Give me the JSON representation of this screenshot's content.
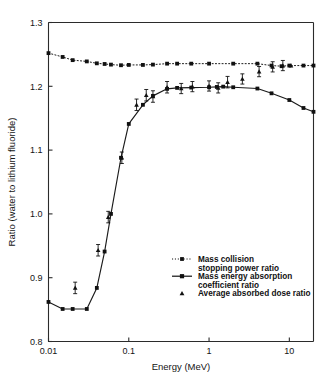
{
  "chart_data": {
    "type": "line",
    "title": "",
    "subtitle": "",
    "xlabel": "Energy (MeV)",
    "ylabel": "Ratio (water to lithium fluoride)",
    "xscale": "log",
    "yscale": "linear",
    "xlim": [
      0.01,
      20
    ],
    "ylim": [
      0.8,
      1.3
    ],
    "xticks": [
      0.01,
      0.1,
      1,
      10
    ],
    "xtick_labels": [
      "0.01",
      "0.1",
      "1",
      "10"
    ],
    "yticks": [
      0.8,
      0.9,
      1.0,
      1.1,
      1.2,
      1.3
    ],
    "ytick_labels": [
      "0.8",
      "0.9",
      "1.0",
      "1.1",
      "1.2",
      "1.3"
    ],
    "grid": false,
    "legend_position": "lower-right",
    "series": [
      {
        "name": "Mass collision stopping power ratio",
        "marker": "square",
        "linestyle": "dotted",
        "color": "#111111",
        "x": [
          0.01,
          0.015,
          0.02,
          0.03,
          0.04,
          0.05,
          0.06,
          0.08,
          0.1,
          0.15,
          0.2,
          0.3,
          0.4,
          0.6,
          1.0,
          2.0,
          4.0,
          6.0,
          8.0,
          10.0,
          15.0,
          20.0
        ],
        "y": [
          1.252,
          1.246,
          1.241,
          1.239,
          1.236,
          1.235,
          1.234,
          1.233,
          1.2335,
          1.2335,
          1.234,
          1.2355,
          1.2355,
          1.2355,
          1.2355,
          1.2355,
          1.2355,
          1.2325,
          1.2315,
          1.2325,
          1.2325,
          1.2325
        ]
      },
      {
        "name": "Mass energy absorption coefficient ratio",
        "marker": "square",
        "linestyle": "solid",
        "color": "#111111",
        "x": [
          0.01,
          0.015,
          0.02,
          0.03,
          0.04,
          0.05,
          0.06,
          0.08,
          0.1,
          0.15,
          0.2,
          0.3,
          0.4,
          0.6,
          1.0,
          1.25,
          1.5,
          2.0,
          4.0,
          6.0,
          10.0,
          15.0,
          20.0
        ],
        "y": [
          0.862,
          0.851,
          0.851,
          0.851,
          0.884,
          0.941,
          1.0,
          1.088,
          1.141,
          1.171,
          1.185,
          1.196,
          1.1975,
          1.198,
          1.1985,
          1.199,
          1.1995,
          1.1985,
          1.1965,
          1.189,
          1.1785,
          1.166,
          1.16
        ]
      },
      {
        "name": "Average absorbed dose ratio",
        "marker": "triangle",
        "linestyle": "none",
        "color": "#111111",
        "x": [
          0.0215,
          0.0415,
          0.0555,
          0.082,
          0.125,
          0.165,
          0.2,
          0.3,
          0.45,
          0.62,
          1.0,
          1.3,
          1.7,
          2.6,
          4.2,
          6.2,
          8.3,
          10.5
        ],
        "y": [
          0.884,
          0.943,
          0.995,
          1.088,
          1.171,
          1.186,
          1.184,
          1.1985,
          1.1965,
          1.1995,
          1.2005,
          1.1975,
          1.2065,
          1.2115,
          1.223,
          1.2305,
          1.2325,
          1.2325
        ],
        "yerr": [
          0.009,
          0.009,
          0.009,
          0.009,
          0.009,
          0.009,
          0.009,
          0.009,
          0.008,
          0.008,
          0.008,
          0.008,
          0.009,
          0.008,
          0.008,
          0.008,
          0.008,
          0.0
        ]
      }
    ],
    "legend": [
      {
        "label_line1": "Mass collision",
        "label_line2": "stopping power ratio",
        "style": "dotted-square"
      },
      {
        "label_line1": "Mass energy absorption",
        "label_line2": "coefficient ratio",
        "style": "solid-square"
      },
      {
        "label_line1": "Average absorbed dose ratio",
        "label_line2": "",
        "style": "triangle-only"
      }
    ]
  }
}
